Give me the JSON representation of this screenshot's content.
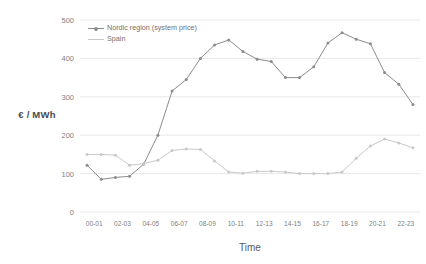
{
  "chart_data": {
    "type": "line",
    "title": "",
    "xlabel": "Time",
    "ylabel": "€ / MWh",
    "ylim": [
      0,
      500
    ],
    "yticks": [
      0,
      100,
      200,
      300,
      400,
      500
    ],
    "grid": true,
    "legend_position": "top-left-inside",
    "x": [
      "00-01",
      "01-02",
      "02-03",
      "03-04",
      "04-05",
      "05-06",
      "06-07",
      "07-08",
      "08-09",
      "09-10",
      "10-11",
      "11-12",
      "12-13",
      "13-14",
      "14-15",
      "15-16",
      "16-17",
      "17-18",
      "18-19",
      "19-20",
      "20-21",
      "21-22",
      "22-23",
      "23-00"
    ],
    "xtick_labels": [
      "00-01",
      "02-03",
      "04-05",
      "06-07",
      "08-09",
      "10-11",
      "12-13",
      "14-15",
      "16-17",
      "18-19",
      "20-21",
      "22-23"
    ],
    "series": [
      {
        "name": "Nordic region (system price)",
        "color": "#8c8c8c",
        "marker": "circle",
        "values": [
          122,
          85,
          90,
          93,
          125,
          200,
          315,
          345,
          400,
          435,
          448,
          418,
          398,
          392,
          350,
          350,
          378,
          440,
          467,
          450,
          438,
          363,
          333,
          280
        ]
      },
      {
        "name": "Spain",
        "color": "#c9c9c9",
        "marker": "circle",
        "values": [
          150,
          150,
          148,
          122,
          126,
          135,
          160,
          164,
          163,
          133,
          104,
          101,
          106,
          106,
          104,
          100,
          100,
          100,
          104,
          140,
          172,
          190,
          180,
          167
        ]
      }
    ]
  },
  "axes": {
    "y_title": "€ / MWh",
    "x_title": "Time"
  },
  "colors": {
    "nordic": "#8c8c8c",
    "spain": "#c9c9c9",
    "grid": "#e8e8e8",
    "text": "#808080"
  }
}
